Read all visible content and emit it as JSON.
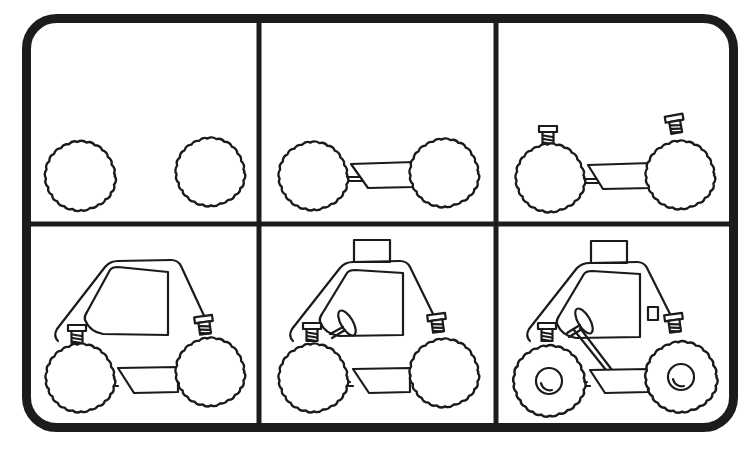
{
  "worksheet": {
    "subject": "How to draw a dune buggy",
    "layout": {
      "rows": 2,
      "columns": 3
    },
    "colors": {
      "ink": "#1a1a1a",
      "frame": "#1c1c1c",
      "background": "#ffffff"
    },
    "panels": [
      {
        "step": 1,
        "content": "two wavy-edged wheels"
      },
      {
        "step": 2,
        "content": "wheels joined by a trapezoid chassis"
      },
      {
        "step": 3,
        "content": "spring suspension added above each wheel"
      },
      {
        "step": 4,
        "content": "rounded cab body with window"
      },
      {
        "step": 5,
        "content": "roof box and steering wheel added"
      },
      {
        "step": 6,
        "content": "hubcaps, steering column and side light added"
      }
    ]
  }
}
